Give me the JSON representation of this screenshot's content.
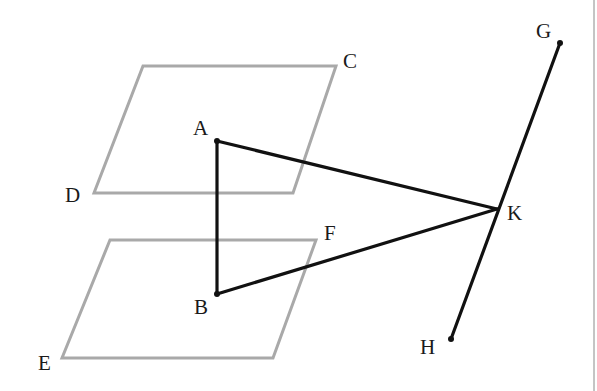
{
  "diagram": {
    "type": "geometry",
    "colors": {
      "plane": "#a9a9a9",
      "segment": "#111111",
      "label": "#1a1a1a"
    },
    "planes": [
      {
        "name": "upper-plane",
        "vertices": [
          [
            143,
            66
          ],
          [
            336,
            66
          ],
          [
            293,
            193
          ],
          [
            94,
            193
          ]
        ],
        "labels": [
          "C",
          "D"
        ]
      },
      {
        "name": "lower-plane",
        "vertices": [
          [
            110,
            240
          ],
          [
            316,
            240
          ],
          [
            273,
            358
          ],
          [
            62,
            358
          ]
        ],
        "labels": [
          "F",
          "E"
        ]
      }
    ],
    "points": {
      "A": [
        217,
        141
      ],
      "B": [
        217,
        294
      ],
      "K": [
        497,
        209
      ],
      "G": [
        560,
        43
      ],
      "H": [
        451,
        339
      ]
    },
    "segments": [
      [
        "A",
        "B"
      ],
      [
        "A",
        "K"
      ],
      [
        "B",
        "K"
      ],
      [
        "G",
        "H"
      ]
    ],
    "labels": {
      "A": "A",
      "B": "B",
      "C": "C",
      "D": "D",
      "E": "E",
      "F": "F",
      "G": "G",
      "H": "H",
      "K": "K"
    }
  }
}
